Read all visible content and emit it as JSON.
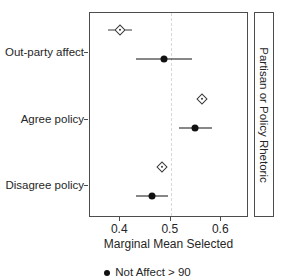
{
  "chart_data": {
    "type": "scatter",
    "title": "",
    "xlabel": "Marginal Mean Selected",
    "ylabel": "",
    "xlim": [
      0.34,
      0.655
    ],
    "xticks": [
      0.4,
      0.5,
      0.6
    ],
    "xticklabels": [
      "0.4",
      "0.5",
      "0.6"
    ],
    "categories": [
      "Out-party affect",
      "Agree policy",
      "Disagree policy"
    ],
    "grid": false,
    "reference_line": 0.5,
    "reference_line_style": "dashed",
    "strip_label": "Partisan or Policy Rhetoric",
    "legend_position": "bottom",
    "series": [
      {
        "name": "Not Affect > 90",
        "marker": "diamond-open",
        "color": "#3a3a3a",
        "points": [
          {
            "category": "Out-party affect",
            "value": 0.399,
            "low": 0.375,
            "high": 0.424
          },
          {
            "category": "Agree policy",
            "value": 0.562,
            "low": 0.553,
            "high": 0.571
          },
          {
            "category": "Disagree policy",
            "value": 0.482,
            "low": 0.473,
            "high": 0.492
          }
        ]
      },
      {
        "name": "Affect > 90",
        "marker": "circle-filled",
        "color": "#111111",
        "points": [
          {
            "category": "Out-party affect",
            "value": 0.487,
            "low": 0.431,
            "high": 0.543
          },
          {
            "category": "Agree policy",
            "value": 0.549,
            "low": 0.516,
            "high": 0.581
          },
          {
            "category": "Disagree policy",
            "value": 0.462,
            "low": 0.431,
            "high": 0.494
          }
        ]
      }
    ],
    "legend_entries": [
      {
        "label": "Not Affect > 90",
        "marker": "circle-filled",
        "color": "#111111"
      }
    ]
  },
  "axis": {
    "x_title": "Marginal Mean Selected",
    "tick_0": "0.4",
    "tick_1": "0.5",
    "tick_2": "0.6"
  },
  "categories": {
    "c0": "Out-party affect",
    "c1": "Agree policy",
    "c2": "Disagree policy"
  },
  "strip": {
    "label": "Partisan or Policy Rhetoric"
  },
  "legend": {
    "entry_0": "Not Affect > 90"
  },
  "colors": {
    "marker_open": "#3a3a3a",
    "marker_filled": "#111111",
    "reference_line": "#d9d9d9",
    "panel_border": "#4d4d4d",
    "text": "#262626"
  }
}
